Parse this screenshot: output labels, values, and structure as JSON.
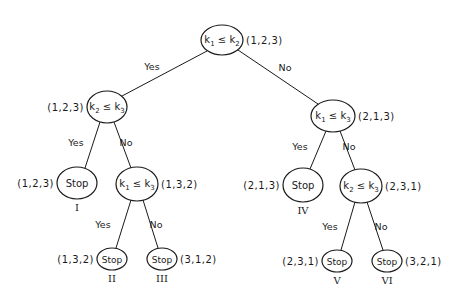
{
  "colors": {
    "ink": "#1a1a1a",
    "background": "#ffffff"
  },
  "nodes": [
    {
      "id": "root",
      "type": "comparison",
      "var_a": "k",
      "sub_a": "1",
      "op": "≤",
      "var_b": "k",
      "sub_b": "2",
      "permutation": "(1,2,3)",
      "permutation_side": "right",
      "cx": 222,
      "cy": 40,
      "rx": 21,
      "ry": 15
    },
    {
      "id": "left",
      "type": "comparison",
      "var_a": "k",
      "sub_a": "2",
      "op": "≤",
      "var_b": "k",
      "sub_b": "3",
      "permutation": "(1,2,3)",
      "permutation_side": "left",
      "cx": 107,
      "cy": 107,
      "rx": 20,
      "ry": 16
    },
    {
      "id": "right",
      "type": "comparison",
      "var_a": "k",
      "sub_a": "1",
      "op": "≤",
      "var_b": "k",
      "sub_b": "3",
      "permutation": "(2,1,3)",
      "permutation_side": "right",
      "cx": 333,
      "cy": 116,
      "rx": 22,
      "ry": 16
    },
    {
      "id": "stop1",
      "type": "stop",
      "label": "Stop",
      "roman": "I",
      "permutation": "(1,2,3)",
      "permutation_side": "left",
      "cx": 77,
      "cy": 183,
      "rx": 20,
      "ry": 16
    },
    {
      "id": "left2",
      "type": "comparison",
      "var_a": "k",
      "sub_a": "1",
      "op": "≤",
      "var_b": "k",
      "sub_b": "3",
      "permutation": "(1,3,2)",
      "permutation_side": "right",
      "cx": 137,
      "cy": 184,
      "rx": 21,
      "ry": 17
    },
    {
      "id": "stop4",
      "type": "stop",
      "label": "Stop",
      "roman": "IV",
      "permutation": "(2,1,3)",
      "permutation_side": "left",
      "cx": 303,
      "cy": 185,
      "rx": 20,
      "ry": 17
    },
    {
      "id": "right2",
      "type": "comparison",
      "var_a": "k",
      "sub_a": "2",
      "op": "≤",
      "var_b": "k",
      "sub_b": "3",
      "permutation": "(2,3,1)",
      "permutation_side": "right",
      "cx": 361,
      "cy": 186,
      "rx": 21,
      "ry": 17
    },
    {
      "id": "stop2",
      "type": "stop",
      "label": "Stop",
      "roman": "II",
      "permutation": "(1,3,2)",
      "permutation_side": "left",
      "cx": 112,
      "cy": 259,
      "rx": 15,
      "ry": 11
    },
    {
      "id": "stop3",
      "type": "stop",
      "label": "Stop",
      "roman": "III",
      "permutation": "(3,1,2)",
      "permutation_side": "right",
      "cx": 162,
      "cy": 259,
      "rx": 15,
      "ry": 11
    },
    {
      "id": "stop5",
      "type": "stop",
      "label": "Stop",
      "roman": "V",
      "permutation": "(2,3,1)",
      "permutation_side": "left",
      "cx": 337,
      "cy": 261,
      "rx": 15,
      "ry": 11
    },
    {
      "id": "stop6",
      "type": "stop",
      "label": "Stop",
      "roman": "VI",
      "permutation": "(3,2,1)",
      "permutation_side": "right",
      "cx": 387,
      "cy": 261,
      "rx": 15,
      "ry": 11
    }
  ],
  "edges": [
    {
      "from": "root",
      "to": "left",
      "label": "Yes",
      "x1": 207,
      "y1": 51,
      "x2": 122,
      "y2": 96,
      "lx": 152,
      "ly": 70
    },
    {
      "from": "root",
      "to": "right",
      "label": "No",
      "x1": 238,
      "y1": 50,
      "x2": 318,
      "y2": 104,
      "lx": 285,
      "ly": 71
    },
    {
      "from": "left",
      "to": "stop1",
      "label": "Yes",
      "x1": 100,
      "y1": 122,
      "x2": 85,
      "y2": 168,
      "lx": 76,
      "ly": 146
    },
    {
      "from": "left",
      "to": "left2",
      "label": "No",
      "x1": 114,
      "y1": 122,
      "x2": 131,
      "y2": 168,
      "lx": 126,
      "ly": 146
    },
    {
      "from": "right",
      "to": "stop4",
      "label": "Yes",
      "x1": 326,
      "y1": 131,
      "x2": 310,
      "y2": 169,
      "lx": 300,
      "ly": 150
    },
    {
      "from": "right",
      "to": "right2",
      "label": "No",
      "x1": 340,
      "y1": 131,
      "x2": 355,
      "y2": 170,
      "lx": 349,
      "ly": 150
    },
    {
      "from": "left2",
      "to": "stop2",
      "label": "Yes",
      "x1": 131,
      "y1": 200,
      "x2": 116,
      "y2": 248,
      "lx": 103,
      "ly": 228
    },
    {
      "from": "left2",
      "to": "stop3",
      "label": "No",
      "x1": 143,
      "y1": 200,
      "x2": 158,
      "y2": 248,
      "lx": 156,
      "ly": 228
    },
    {
      "from": "right2",
      "to": "stop5",
      "label": "Yes",
      "x1": 355,
      "y1": 202,
      "x2": 341,
      "y2": 250,
      "lx": 330,
      "ly": 230
    },
    {
      "from": "right2",
      "to": "stop6",
      "label": "No",
      "x1": 367,
      "y1": 202,
      "x2": 383,
      "y2": 250,
      "lx": 381,
      "ly": 230
    }
  ]
}
